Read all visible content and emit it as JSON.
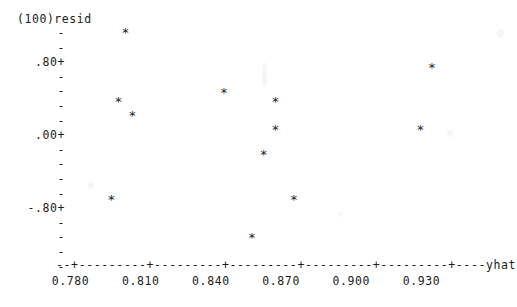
{
  "plot": {
    "y_axis_header": "(100)resid",
    "x_axis_label": "yhat",
    "y_tick_labels": [
      ".80+",
      ".00+",
      "-.80+"
    ],
    "y_minor_tick": "-",
    "x_axis_art": "--+---------+---------+---------+---------+---------+----",
    "x_tick_labels": [
      "0.780",
      "0.810",
      "0.840",
      "0.870",
      "0.900",
      "0.930"
    ],
    "point_glyph": "*",
    "ink_color": "#1c1c1c"
  },
  "chart_data": {
    "type": "scatter",
    "title": "",
    "xlabel": "yhat",
    "ylabel": "(100)resid",
    "xlim": [
      0.768,
      0.948
    ],
    "ylim": [
      -1.6,
      1.45
    ],
    "xticks": [
      0.78,
      0.81,
      0.84,
      0.87,
      0.9,
      0.93
    ],
    "xtick_labels": [
      "0.780",
      "0.810",
      "0.840",
      "0.870",
      "0.900",
      "0.930"
    ],
    "yticks": [
      0.8,
      0.0,
      -0.8
    ],
    "ytick_labels": [
      ".80+",
      ".00+",
      "-.80+"
    ],
    "grid": false,
    "legend": false,
    "marker": "*",
    "points": [
      {
        "x": 0.8035,
        "y": 1.12
      },
      {
        "x": 0.9345,
        "y": 0.72
      },
      {
        "x": 0.8455,
        "y": 0.43
      },
      {
        "x": 0.8005,
        "y": 0.32
      },
      {
        "x": 0.8675,
        "y": 0.32
      },
      {
        "x": 0.8065,
        "y": 0.16
      },
      {
        "x": 0.8675,
        "y": 0.0
      },
      {
        "x": 0.9295,
        "y": 0.0
      },
      {
        "x": 0.8625,
        "y": -0.29
      },
      {
        "x": 0.7975,
        "y": -0.8
      },
      {
        "x": 0.8755,
        "y": -0.8
      },
      {
        "x": 0.8575,
        "y": -1.24
      }
    ]
  }
}
